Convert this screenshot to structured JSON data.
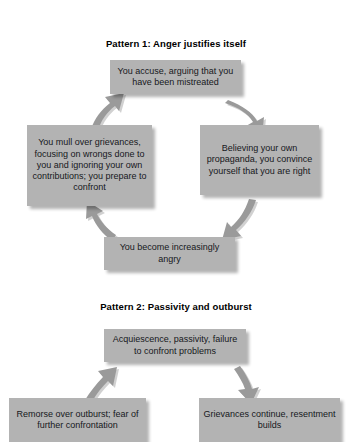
{
  "figure": {
    "patterns": [
      {
        "id": "pattern-1",
        "title": "Pattern 1: Anger justifies itself",
        "nodes": [
          {
            "id": "p1-top",
            "text": "You accuse, arguing that you have been mistreated"
          },
          {
            "id": "p1-right",
            "text": "Believing your own propaganda, you convince yourself that you are right"
          },
          {
            "id": "p1-bottom",
            "text": "You become increasingly angry"
          },
          {
            "id": "p1-left",
            "text": "You mull over grievances, focusing on wrongs done to you and ignoring your own contributions; you prepare to confront"
          }
        ],
        "arrows": [
          {
            "id": "p1-arrow-top-to-right",
            "from": "p1-top",
            "to": "p1-right"
          },
          {
            "id": "p1-arrow-right-to-bottom",
            "from": "p1-right",
            "to": "p1-bottom"
          },
          {
            "id": "p1-arrow-bottom-to-left",
            "from": "p1-bottom",
            "to": "p1-left"
          },
          {
            "id": "p1-arrow-left-to-top",
            "from": "p1-left",
            "to": "p1-top"
          }
        ]
      },
      {
        "id": "pattern-2",
        "title": "Pattern 2: Passivity and outburst",
        "nodes": [
          {
            "id": "p2-top",
            "text": "Acquiescence, passivity, failure to confront problems"
          },
          {
            "id": "p2-right",
            "text": "Grievances continue, resentment builds"
          },
          {
            "id": "p2-left",
            "text": "Remorse over outburst; fear of further confrontation"
          }
        ],
        "arrows": [
          {
            "id": "p2-arrow-top-to-right",
            "from": "p2-top",
            "to": "p2-right"
          },
          {
            "id": "p2-arrow-left-to-top",
            "from": "p2-left",
            "to": "p2-top"
          }
        ]
      }
    ],
    "colors": {
      "node_fill": "#b3b3b3",
      "node_text": "#16181c",
      "arrow_fill": "#9a9a9a",
      "background": "#ffffff"
    }
  }
}
